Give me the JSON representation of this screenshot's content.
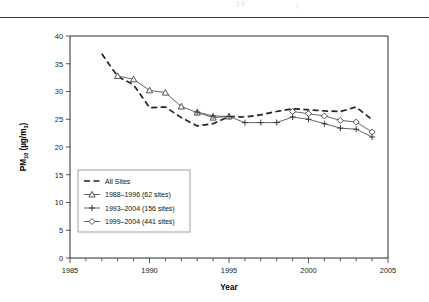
{
  "header": {
    "ghost_left": "10",
    "ghost_right": "|"
  },
  "chart_data": {
    "type": "line",
    "title": "",
    "xlabel": "Year",
    "ylabel": "PM10 (µg/m3)",
    "ylabel_main": "PM",
    "ylabel_sub": "10",
    "ylabel_unit": " (µg/m",
    "ylabel_unit_sub": "3",
    "ylabel_unit_end": ")",
    "xlim": [
      1985,
      2005
    ],
    "ylim": [
      0,
      40
    ],
    "xticks": [
      1985,
      1990,
      1995,
      2000,
      2005
    ],
    "xticklabels": [
      "1985",
      "1990",
      "1995",
      "2000",
      "2005"
    ],
    "xminor_step": 1,
    "yticks": [
      0,
      5,
      10,
      15,
      20,
      25,
      30,
      35,
      40
    ],
    "yticklabels": [
      "0",
      "5",
      "10",
      "15",
      "20",
      "25",
      "30",
      "35",
      "40"
    ],
    "grid": false,
    "legend_position": "lower-left",
    "series": [
      {
        "name": "All Sites",
        "style": "dashed",
        "marker": "none",
        "color": "#222222",
        "x": [
          1987,
          1988,
          1989,
          1990,
          1991,
          1992,
          1993,
          1994,
          1995,
          1996,
          1997,
          1998,
          1999,
          2000,
          2001,
          2002,
          2003,
          2004
        ],
        "values": [
          36.8,
          32.7,
          31.2,
          27.1,
          27.2,
          25.3,
          23.8,
          24.2,
          25.5,
          25.4,
          25.8,
          26.4,
          26.9,
          26.7,
          26.5,
          26.4,
          27.2,
          24.9
        ]
      },
      {
        "name": "1988–1996 (62 sites)",
        "style": "solid",
        "marker": "triangle",
        "color": "#4a4a4a",
        "x": [
          1988,
          1989,
          1990,
          1991,
          1992,
          1993,
          1994,
          1995
        ],
        "values": [
          32.8,
          32.2,
          30.2,
          29.8,
          27.3,
          26.2,
          25.3,
          25.5
        ]
      },
      {
        "name": "1993–2004 (156 sites)",
        "style": "solid",
        "marker": "plus",
        "color": "#4a4a4a",
        "x": [
          1993,
          1994,
          1995,
          1996,
          1997,
          1998,
          1999,
          2000,
          2001,
          2002,
          2003,
          2004
        ],
        "values": [
          26.3,
          25.6,
          25.5,
          24.4,
          24.4,
          24.4,
          25.4,
          25.0,
          24.2,
          23.4,
          23.2,
          21.8
        ]
      },
      {
        "name": "1999–2004 (441 sites)",
        "style": "solid",
        "marker": "diamond",
        "color": "#4a4a4a",
        "x": [
          1999,
          2000,
          2001,
          2002,
          2003,
          2004
        ],
        "values": [
          26.4,
          26.0,
          25.6,
          24.8,
          24.5,
          22.7
        ]
      }
    ],
    "legend": [
      {
        "label": "All Sites",
        "marker": "none",
        "style": "dashed"
      },
      {
        "label": "1988–1996 (62 sites)",
        "marker": "triangle",
        "style": "solid"
      },
      {
        "label": "1993–2004 (156 sites)",
        "marker": "plus",
        "style": "solid"
      },
      {
        "label": "1999–2004 (441 sites)",
        "marker": "diamond",
        "style": "solid"
      }
    ]
  }
}
